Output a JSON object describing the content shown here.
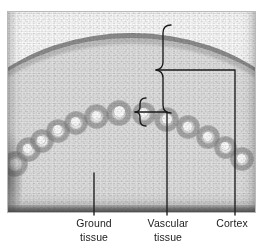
{
  "figure": {
    "type": "light-micrograph"
  },
  "annotations": {
    "ground_tissue": {
      "label": "Ground\ntissue",
      "label_line1": "Ground",
      "label_line2": "tissue",
      "pointer": "line",
      "target": "central pith region"
    },
    "vascular_tissue": {
      "label": "Vascular\ntissue",
      "label_line1": "Vascular",
      "label_line2": "tissue",
      "pointer": "brace",
      "target": "ring of vascular bundles"
    },
    "cortex": {
      "label": "Cortex",
      "pointer": "brace",
      "target": "outer tissue between epidermis and vascular ring"
    }
  },
  "colors": {
    "leader_line": "#1b1b1b",
    "label_text": "#1b1b1b",
    "frame_border": "#b9b9b9",
    "page_background": "#ffffff",
    "tissue_light": "#e0e0e0",
    "epidermis_dark": "#5c5c5c"
  }
}
